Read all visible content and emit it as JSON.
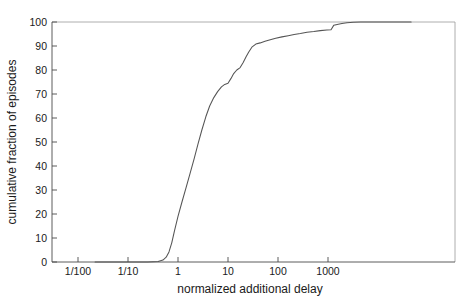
{
  "chart_data": {
    "type": "line",
    "title": "",
    "subtitle": "",
    "xlabel": "normalized additional delay",
    "ylabel": "cumulative fraction of episodes",
    "xscale": "log",
    "yscale": "linear",
    "xlim": [
      0.022,
      46000
    ],
    "ylim": [
      0,
      100
    ],
    "grid": false,
    "legend": null,
    "xtick_labels": [
      "1/100",
      "1/10",
      "1",
      "10",
      "100",
      "1000"
    ],
    "xtick_values": [
      0.01,
      0.1,
      1,
      10,
      100,
      1000
    ],
    "ytick_labels": [
      "0",
      "10",
      "20",
      "30",
      "40",
      "50",
      "60",
      "70",
      "80",
      "90",
      "100"
    ],
    "ytick_values": [
      0,
      10,
      20,
      30,
      40,
      50,
      60,
      70,
      80,
      90,
      100
    ],
    "series": [
      {
        "name": "cumulative distribution",
        "color": "#555555",
        "x": [
          0.022,
          0.1,
          0.25,
          0.4,
          0.5,
          0.58,
          0.66,
          0.75,
          0.85,
          1.0,
          1.2,
          1.45,
          1.75,
          2.1,
          2.5,
          3.0,
          3.6,
          4.3,
          5.2,
          6.2,
          7.4,
          8.6,
          10.0,
          11.5,
          13.0,
          15.0,
          17.5,
          20.0,
          23.0,
          26.0,
          30.0,
          36.0,
          44.0,
          55.0,
          70.0,
          90.0,
          120.0,
          160.0,
          210.0,
          280.0,
          380.0,
          520.0,
          700.0,
          950.0,
          1150.0,
          1300.0,
          1450.0,
          1600.0,
          1900.0,
          2400.0,
          3200.0,
          4500.0,
          7000.0,
          12000.0,
          25000.0,
          46000.0
        ],
        "y": [
          0.0,
          0.0,
          0.0,
          0.2,
          0.8,
          2.0,
          4.2,
          8.0,
          13.0,
          19.0,
          25.0,
          31.0,
          37.0,
          43.0,
          49.0,
          55.0,
          60.5,
          65.0,
          68.5,
          71.0,
          73.0,
          74.0,
          74.5,
          76.5,
          78.5,
          80.0,
          81.0,
          83.0,
          85.5,
          87.5,
          89.5,
          90.8,
          91.3,
          92.0,
          92.6,
          93.2,
          93.8,
          94.3,
          94.8,
          95.2,
          95.7,
          96.0,
          96.4,
          96.7,
          96.8,
          98.6,
          98.9,
          99.1,
          99.4,
          99.7,
          99.9,
          100.0,
          100.0,
          100.0,
          100.0,
          100.0
        ]
      }
    ],
    "annotations": []
  },
  "figure": {
    "background_color": "#ffffff",
    "line_color": "#555555",
    "axis_color": "#4a4a4a",
    "frame_color": "#9a9a9a",
    "text_color": "#1a1a1a"
  }
}
